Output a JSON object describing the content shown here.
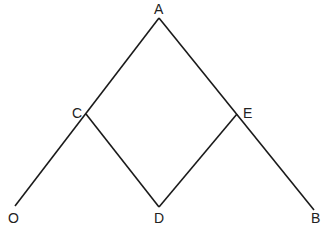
{
  "diagram": {
    "points": {
      "A": {
        "label": "A"
      },
      "C": {
        "label": "C"
      },
      "E": {
        "label": "E"
      },
      "O": {
        "label": "O"
      },
      "D": {
        "label": "D"
      },
      "B": {
        "label": "B"
      }
    },
    "segments": [
      "O-A",
      "A-B",
      "C-D",
      "D-E"
    ],
    "line_color": "#1a1a1a"
  }
}
